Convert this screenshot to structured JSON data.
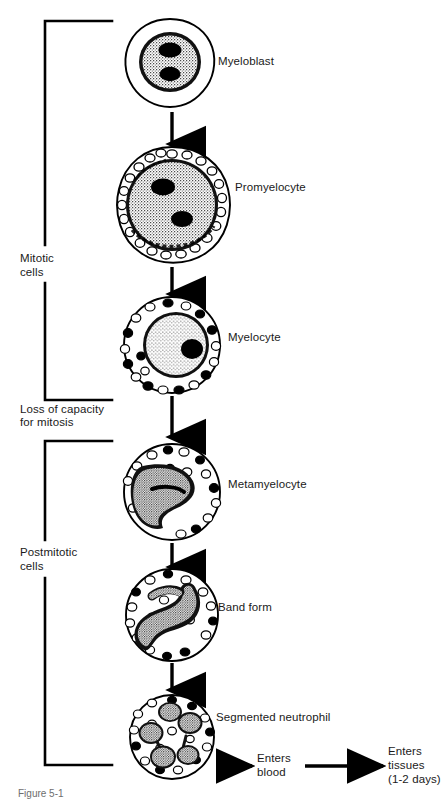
{
  "figure": {
    "background_color": "#ffffff",
    "ink_color": "#000000"
  },
  "brackets": [
    {
      "id": "mitotic",
      "label_line1": "Mitotic",
      "label_line2": "cells"
    },
    {
      "id": "postmitotic",
      "label_line1": "Postmitotic",
      "label_line2": "cells"
    }
  ],
  "notes": [
    {
      "id": "loss-of-mitosis",
      "line1": "Loss of capacity",
      "line2": "for mitosis"
    }
  ],
  "stages": [
    {
      "id": "myeloblast",
      "label": "Myeloblast"
    },
    {
      "id": "promyelocyte",
      "label": "Promyelocyte"
    },
    {
      "id": "myelocyte",
      "label": "Myelocyte"
    },
    {
      "id": "metamyelocyte",
      "label": "Metamyelocyte"
    },
    {
      "id": "band-form",
      "label": "Band form"
    },
    {
      "id": "segmented-neutrophil",
      "label": "Segmented neutrophil"
    }
  ],
  "fates": [
    {
      "id": "enters-blood",
      "line1": "Enters",
      "line2": "blood",
      "line3": ""
    },
    {
      "id": "enters-tissues",
      "line1": "Enters",
      "line2": "tissues",
      "line3": "(1-2 days)"
    }
  ],
  "caption": {
    "text": "Figure 5-1"
  }
}
